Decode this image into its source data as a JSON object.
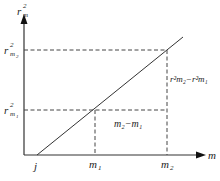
{
  "diagram": {
    "type": "linear-graph",
    "y_axis_label": "r",
    "y_axis_sup": "2",
    "y_axis_sub": "m",
    "x_axis_label": "m",
    "origin_label": "j",
    "y_ticks": [
      {
        "base": "r",
        "sup": "2",
        "sub": "m",
        "subsub": "2"
      },
      {
        "base": "r",
        "sup": "2",
        "sub": "m",
        "subsub": "1"
      }
    ],
    "x_ticks": [
      {
        "base": "m",
        "sub": "1"
      },
      {
        "base": "m",
        "sub": "2"
      }
    ],
    "delta_x_label": "m₂−m₁",
    "delta_y_label": "r²m₂−r²m₁",
    "colors": {
      "line": "#333333",
      "dashed": "#444444"
    }
  }
}
